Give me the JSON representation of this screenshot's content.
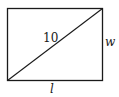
{
  "diagram": {
    "type": "rectangle-with-diagonal",
    "labels": {
      "diagonal": "10",
      "width": "w",
      "length": "l"
    },
    "colors": {
      "stroke": "#1a1a1a",
      "background": "#ffffff"
    }
  }
}
